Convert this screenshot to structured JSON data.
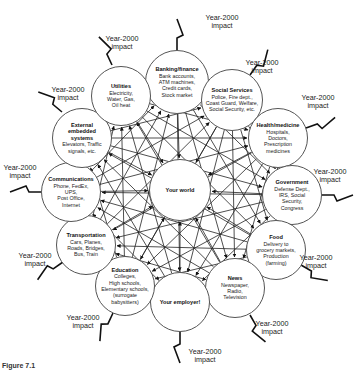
{
  "diagram": {
    "center": {
      "title": "Your world"
    },
    "impact_label_line1": "Year-2000",
    "impact_label_line2": "impact",
    "nodes": [
      {
        "id": "banking",
        "title": "Banking/finance",
        "desc": [
          "Bank accounts,",
          "ATM machines,",
          "Credit cards,",
          "Stock market"
        ]
      },
      {
        "id": "social",
        "title": "Social Services",
        "desc": [
          "Police, Fire dept.,",
          "Coast Guard, Welfare,",
          "Social Security, etc."
        ]
      },
      {
        "id": "health",
        "title": "Health/medicine",
        "desc": [
          "Hospitals,",
          "Doctors,",
          "Prescription",
          "medicines"
        ]
      },
      {
        "id": "government",
        "title": "Government",
        "desc": [
          "Defense Dept.,",
          "IRS, Social",
          "Security,",
          "Congress"
        ]
      },
      {
        "id": "food",
        "title": "Food",
        "desc": [
          "Delivery to",
          "grocery markets,",
          "Production",
          "(farming)"
        ]
      },
      {
        "id": "news",
        "title": "News",
        "desc": [
          "Newspaper,",
          "Radio,",
          "Television"
        ]
      },
      {
        "id": "employer",
        "title": "Your employer!",
        "desc": []
      },
      {
        "id": "education",
        "title": "Education",
        "desc": [
          "Colleges,",
          "High schools,",
          "Elementary schools,",
          "(surrogate",
          "babysitters)"
        ]
      },
      {
        "id": "transportation",
        "title": "Transportation",
        "desc": [
          "Cars, Planes,",
          "Roads, Bridges,",
          "Bus, Train"
        ]
      },
      {
        "id": "communications",
        "title": "Communications",
        "desc": [
          "Phone, FedEx,",
          "UPS,",
          "Post Office,",
          "Internet"
        ]
      },
      {
        "id": "embedded",
        "title": "External embedded systems",
        "desc": [
          "Elevators, Traffic",
          "signals, etc."
        ]
      },
      {
        "id": "utilities",
        "title": "Utilities",
        "desc": [
          "Electricity,",
          "Water, Gas,",
          "Oil heat"
        ]
      }
    ],
    "caption": "Figure 7.1"
  }
}
